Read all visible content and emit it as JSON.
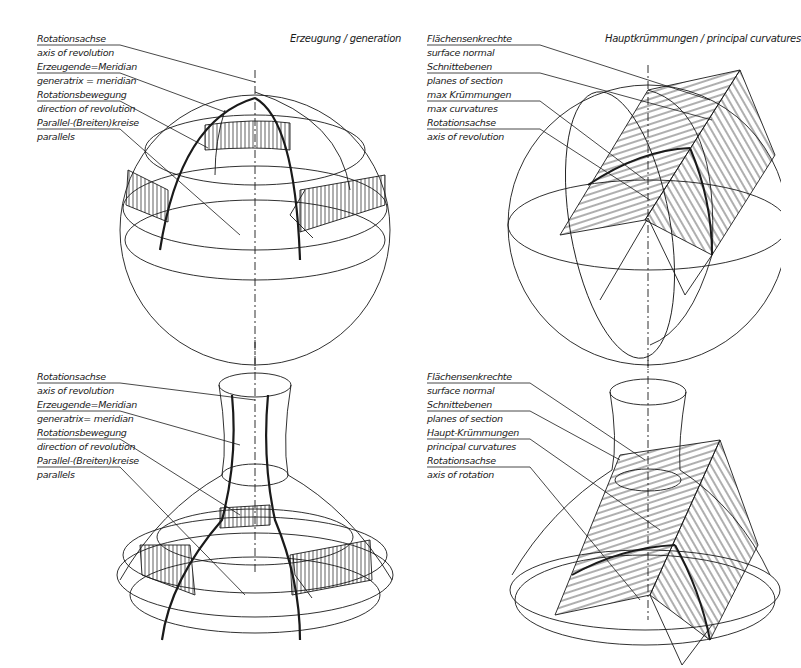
{
  "panels": {
    "generation_title": "Erzeugung / generation",
    "curvatures_title": "Hauptkrümmungen / principal curvatures"
  },
  "sphere_generation": {
    "labels": [
      "Rotationsachse",
      "axis of revolution",
      "Erzeugende=Meridian",
      "generatrix = meridian",
      "Rotationsbewegung",
      "direction of revolution",
      "Parallel-(Breiten)kreise",
      "parallels"
    ]
  },
  "sphere_curvatures": {
    "labels": [
      "Flächensenkrechte",
      "surface normal",
      "Schnittebenen",
      "planes of section",
      "max Krümmungen",
      "max curvatures",
      "Rotationsachse",
      "axis of revolution"
    ]
  },
  "carafe_generation": {
    "labels": [
      "Rotationsachse",
      "axis of revolution",
      "Erzeugende=Meridian",
      "generatrix= meridian",
      "Rotationsbewegung",
      "direction of revolution",
      "Parallel-(Breiten)kreise",
      "parallels"
    ]
  },
  "carafe_curvatures": {
    "labels": [
      "Flächensenkrechte",
      "surface normal",
      "Schnittebenen",
      "planes of section",
      "Haupt-Krümmungen",
      "principal curvatures",
      "Rotationsachse",
      "axis of rotation"
    ]
  }
}
